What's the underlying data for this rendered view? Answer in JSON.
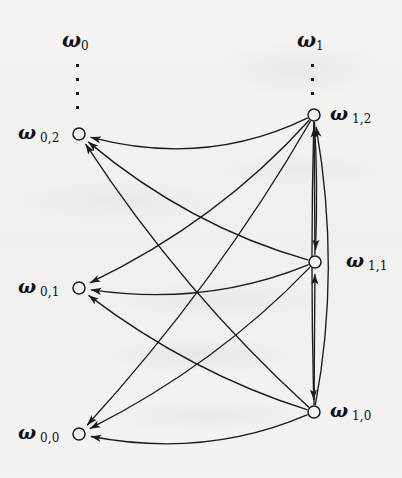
{
  "figure": {
    "kind": "directed-graph-diagram",
    "width": 402,
    "height": 478,
    "background_color": "#f3f2f0",
    "ink_color": "#1a1a1a"
  },
  "families": [
    {
      "id": "omega-0",
      "label": "ω",
      "sub": "0",
      "x": 78,
      "y": 42,
      "ellipsis_dots": 4,
      "ellipsis_x": 78,
      "ellipsis_y": 64
    },
    {
      "id": "omega-1",
      "label": "ω",
      "sub": "1",
      "x": 313,
      "y": 42,
      "ellipsis_dots": 3,
      "ellipsis_x": 313,
      "ellipsis_y": 64
    }
  ],
  "nodes": [
    {
      "id": "w02",
      "label": "ω",
      "sub": "0,2",
      "cx": 79,
      "cy": 134,
      "r": 6,
      "label_side": "left",
      "label_x": 18,
      "label_y": 134
    },
    {
      "id": "w01",
      "label": "ω",
      "sub": "0,1",
      "cx": 79,
      "cy": 288,
      "r": 6,
      "label_side": "left",
      "label_x": 18,
      "label_y": 288
    },
    {
      "id": "w00",
      "label": "ω",
      "sub": "0,0",
      "cx": 79,
      "cy": 434,
      "r": 6,
      "label_side": "left",
      "label_x": 18,
      "label_y": 434
    },
    {
      "id": "w12",
      "label": "ω",
      "sub": "1,2",
      "cx": 314,
      "cy": 115,
      "r": 6,
      "label_side": "right",
      "label_x": 330,
      "label_y": 115
    },
    {
      "id": "w11",
      "label": "ω",
      "sub": "1,1",
      "cx": 315,
      "cy": 262,
      "r": 6,
      "label_side": "right",
      "label_x": 346,
      "label_y": 262
    },
    {
      "id": "w10",
      "label": "ω",
      "sub": "1,0",
      "cx": 314,
      "cy": 412,
      "r": 6,
      "label_side": "right",
      "label_x": 330,
      "label_y": 412
    }
  ],
  "edges": [
    {
      "id": "e-w12-w02",
      "from": "w12",
      "to": "w02",
      "style": "curve",
      "bow": -46
    },
    {
      "id": "e-w11-w02",
      "from": "w11",
      "to": "w02",
      "style": "curve",
      "bow": -30
    },
    {
      "id": "e-w10-w02",
      "from": "w10",
      "to": "w02",
      "style": "curve",
      "bow": -24
    },
    {
      "id": "e-w12-w01",
      "from": "w12",
      "to": "w01",
      "style": "curve",
      "bow": -30
    },
    {
      "id": "e-w11-w01",
      "from": "w11",
      "to": "w01",
      "style": "curve",
      "bow": -34
    },
    {
      "id": "e-w10-w01",
      "from": "w10",
      "to": "w01",
      "style": "curve",
      "bow": -24
    },
    {
      "id": "e-w12-w00",
      "from": "w12",
      "to": "w00",
      "style": "curve",
      "bow": -22
    },
    {
      "id": "e-w11-w00",
      "from": "w11",
      "to": "w00",
      "style": "curve",
      "bow": -26
    },
    {
      "id": "e-w10-w00",
      "from": "w10",
      "to": "w00",
      "style": "curve",
      "bow": -38
    },
    {
      "id": "e-w10-w11",
      "from": "w10",
      "to": "w11",
      "style": "straight",
      "bow": 0
    },
    {
      "id": "e-w11-w12",
      "from": "w11",
      "to": "w12",
      "style": "straight",
      "bow": 0
    },
    {
      "id": "e-w12-w11",
      "from": "w12",
      "to": "w11",
      "style": "straight",
      "bow": -4
    },
    {
      "id": "e-w12-w10",
      "from": "w12",
      "to": "w10",
      "style": "straight",
      "bow": 4
    },
    {
      "id": "e-w10-w12",
      "from": "w10",
      "to": "w12",
      "style": "curve",
      "bow": 28
    }
  ],
  "caption": ""
}
